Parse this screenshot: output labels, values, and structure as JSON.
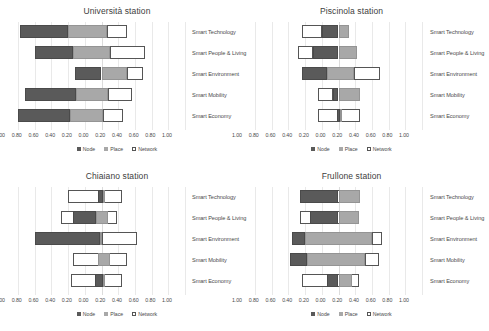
{
  "figure": {
    "axis_ticks": [
      "1.00",
      "0.80",
      "0.60",
      "0.40",
      "0.20",
      "0.00",
      "0.20",
      "0.40",
      "0.60",
      "0.80",
      "1.00"
    ],
    "categories": [
      "Smart Technology",
      "Smart People & Living",
      "Smart Environment",
      "Smart Mobility",
      "Smart Economy"
    ],
    "legend": [
      {
        "label": "Node",
        "color": "#5a5a5a",
        "key": "node"
      },
      {
        "label": "Place",
        "color": "#a8a8a8",
        "key": "place"
      },
      {
        "label": "Network",
        "color": "#ffffff",
        "key": "network"
      }
    ],
    "colors": {
      "node": "#5a5a5a",
      "place": "#a8a8a8",
      "network": "#ffffff",
      "grid": "#e9e9e9"
    }
  },
  "chart_data": [
    {
      "type": "bar",
      "title": "Università station",
      "orientation": "horizontal-diverging-stacked",
      "xlabel": "",
      "ylabel": "",
      "xlim": [
        -1.0,
        1.0
      ],
      "grid": true,
      "legend_position": "bottom",
      "categories": [
        "Smart Technology",
        "Smart People & Living",
        "Smart Environment",
        "Smart Mobility",
        "Smart Economy"
      ],
      "tick_labels": [
        "1.00",
        "0.80",
        "0.60",
        "0.40",
        "0.20",
        "0.00",
        "0.20",
        "0.40",
        "0.60",
        "0.80",
        "1.00"
      ],
      "series": [
        {
          "name": "Node",
          "values": [
            [
              -0.98,
              -0.4
            ],
            [
              -0.8,
              -0.34
            ],
            [
              -0.32,
              0.0
            ],
            [
              -0.92,
              -0.3
            ],
            [
              -1.0,
              -0.38
            ]
          ]
        },
        {
          "name": "Place",
          "values": [
            [
              -0.4,
              0.06
            ],
            [
              -0.34,
              0.1
            ],
            [
              0.0,
              0.3
            ],
            [
              -0.3,
              0.08
            ],
            [
              -0.38,
              0.02
            ]
          ]
        },
        {
          "name": "Network",
          "values": [
            [
              0.06,
              0.3
            ],
            [
              0.1,
              0.52
            ],
            [
              0.3,
              0.5
            ],
            [
              0.08,
              0.36
            ],
            [
              0.02,
              0.26
            ]
          ]
        }
      ]
    },
    {
      "type": "bar",
      "title": "Piscinola station",
      "orientation": "horizontal-diverging-stacked",
      "xlabel": "",
      "ylabel": "",
      "xlim": [
        -1.0,
        1.0
      ],
      "grid": true,
      "legend_position": "bottom",
      "categories": [
        "Smart Technology",
        "Smart People & Living",
        "Smart Environment",
        "Smart Mobility",
        "Smart Economy"
      ],
      "tick_labels": [
        "1.00",
        "0.80",
        "0.60",
        "0.40",
        "0.20",
        "0.00",
        "0.20",
        "0.40",
        "0.60",
        "0.80",
        "1.00"
      ],
      "series": [
        {
          "name": "Node",
          "values": [
            [
              -0.2,
              0.0
            ],
            [
              -0.3,
              0.0
            ],
            [
              -0.44,
              -0.14
            ],
            [
              -0.06,
              0.0
            ],
            [
              -0.02,
              0.02
            ]
          ]
        },
        {
          "name": "Place",
          "values": [
            [
              0.0,
              0.12
            ],
            [
              0.0,
              0.22
            ],
            [
              -0.14,
              0.18
            ],
            [
              0.0,
              0.26
            ],
            [
              0.02,
              0.04
            ]
          ]
        },
        {
          "name": "Network",
          "values": [
            [
              -0.44,
              -0.2
            ],
            [
              -0.48,
              -0.3
            ],
            [
              0.18,
              0.5
            ],
            [
              -0.24,
              -0.06
            ],
            [
              -0.24,
              0.26
            ]
          ]
        }
      ]
    },
    {
      "type": "bar",
      "title": "Chiaiano station",
      "orientation": "horizontal-diverging-stacked",
      "xlabel": "",
      "ylabel": "",
      "xlim": [
        -1.0,
        1.0
      ],
      "grid": true,
      "legend_position": "bottom",
      "categories": [
        "Smart Technology",
        "Smart People & Living",
        "Smart Environment",
        "Smart Mobility",
        "Smart Economy"
      ],
      "tick_labels": [
        "1.00",
        "0.80",
        "0.60",
        "0.40",
        "0.20",
        "0.00",
        "0.20",
        "0.40",
        "0.60",
        "0.80",
        "1.00"
      ],
      "series": [
        {
          "name": "Node",
          "values": [
            [
              -0.04,
              0.02
            ],
            [
              -0.34,
              -0.06
            ],
            [
              -0.8,
              -0.02
            ],
            [
              0.0,
              0.0
            ],
            [
              -0.08,
              0.02
            ]
          ]
        },
        {
          "name": "Place",
          "values": [
            [
              0.02,
              0.04
            ],
            [
              -0.06,
              0.08
            ],
            [
              -0.02,
              0.0
            ],
            [
              -0.04,
              0.1
            ],
            [
              0.02,
              0.04
            ]
          ]
        },
        {
          "name": "Network",
          "values": [
            [
              -0.4,
              0.24
            ],
            [
              -0.48,
              0.18
            ],
            [
              0.0,
              0.42
            ],
            [
              -0.34,
              0.3
            ],
            [
              -0.36,
              0.24
            ]
          ]
        }
      ]
    },
    {
      "type": "bar",
      "title": "Frullone station",
      "orientation": "horizontal-diverging-stacked",
      "xlabel": "",
      "ylabel": "",
      "xlim": [
        -1.0,
        1.0
      ],
      "grid": true,
      "legend_position": "bottom",
      "categories": [
        "Smart Technology",
        "Smart People & Living",
        "Smart Environment",
        "Smart Mobility",
        "Smart Economy"
      ],
      "tick_labels": [
        "1.00",
        "0.80",
        "0.60",
        "0.40",
        "0.20",
        "0.00",
        "0.20",
        "0.40",
        "0.60",
        "0.80",
        "1.00"
      ],
      "series": [
        {
          "name": "Node",
          "values": [
            [
              -0.46,
              0.0
            ],
            [
              -0.34,
              0.0
            ],
            [
              -0.56,
              -0.4
            ],
            [
              -0.58,
              -0.38
            ],
            [
              -0.14,
              0.0
            ]
          ]
        },
        {
          "name": "Place",
          "values": [
            [
              0.0,
              0.26
            ],
            [
              0.0,
              0.24
            ],
            [
              -0.4,
              0.4
            ],
            [
              -0.38,
              0.32
            ],
            [
              0.0,
              0.16
            ]
          ]
        },
        {
          "name": "Network",
          "values": [
            [
              -0.46,
              0.26
            ],
            [
              -0.46,
              0.24
            ],
            [
              0.4,
              0.52
            ],
            [
              0.32,
              0.48
            ],
            [
              -0.44,
              0.24
            ]
          ]
        }
      ]
    }
  ]
}
